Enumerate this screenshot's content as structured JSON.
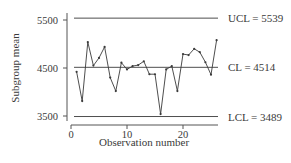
{
  "chart_data": {
    "type": "line",
    "title": "",
    "xlabel": "Observation number",
    "ylabel": "Subgroup mean",
    "x": [
      1,
      2,
      3,
      4,
      5,
      6,
      7,
      8,
      9,
      10,
      11,
      12,
      13,
      14,
      15,
      16,
      17,
      18,
      19,
      20,
      21,
      22,
      23,
      24,
      25,
      26
    ],
    "series": [
      {
        "name": "Subgroup mean",
        "values": [
          4420,
          3810,
          5040,
          4550,
          4710,
          4940,
          4300,
          4020,
          4610,
          4470,
          4540,
          4560,
          4640,
          4370,
          4370,
          3540,
          4470,
          4540,
          4020,
          4790,
          4770,
          4900,
          4830,
          4620,
          4360,
          5080
        ]
      }
    ],
    "control_limits": [
      {
        "name": "UCL",
        "value": 5539,
        "label": "UCL = 5539"
      },
      {
        "name": "CL",
        "value": 4514,
        "label": "CL = 4514"
      },
      {
        "name": "LCL",
        "value": 3489,
        "label": "LCL = 3489"
      }
    ],
    "xticks": [
      0,
      10,
      20
    ],
    "xtick_labels": [
      "0",
      "10",
      "20"
    ],
    "yticks": [
      3500,
      4500,
      5500
    ],
    "ytick_labels": [
      "3500",
      "4500",
      "5500"
    ],
    "xlim": [
      0,
      26.5
    ],
    "ylim": [
      3350,
      5650
    ],
    "grid": false,
    "legend": "none"
  },
  "colors": {
    "line": "#3a3a3a",
    "control_line": "#3a3a3a",
    "axis": "#555555"
  }
}
